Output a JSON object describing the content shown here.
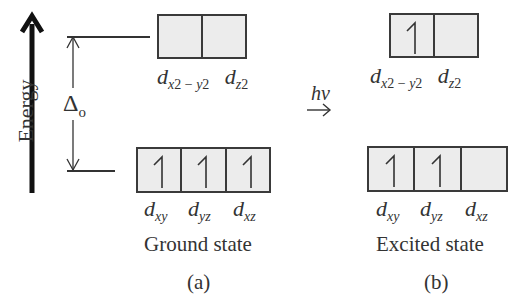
{
  "axis": {
    "label": "Energy",
    "icon": "up-arrow"
  },
  "splitting": {
    "symbol": "Δ",
    "subscript": "o"
  },
  "transition": {
    "label": "hν",
    "icon": "right-arrow"
  },
  "ground": {
    "caption": "Ground state",
    "panel": "(a)",
    "eg": [
      {
        "orbital": "x²−y²",
        "electrons": 0
      },
      {
        "orbital": "z²",
        "electrons": 0
      }
    ],
    "t2g": [
      {
        "orbital": "xy",
        "electrons": 1
      },
      {
        "orbital": "yz",
        "electrons": 1
      },
      {
        "orbital": "xz",
        "electrons": 1
      }
    ],
    "eg_labels": {
      "d1": "d",
      "s1": "x",
      "p1": "2",
      "m": " − ",
      "s1b": "y",
      "p1b": "2",
      "d2": "d",
      "s2": "z",
      "p2": "2"
    },
    "t2g_labels": {
      "d": "d",
      "a": "xy",
      "b": "yz",
      "c": "xz"
    }
  },
  "excited": {
    "caption": "Excited state",
    "panel": "(b)",
    "eg": [
      {
        "orbital": "x²−y²",
        "electrons": 1
      },
      {
        "orbital": "z²",
        "electrons": 0
      }
    ],
    "t2g": [
      {
        "orbital": "xy",
        "electrons": 1
      },
      {
        "orbital": "yz",
        "electrons": 1
      },
      {
        "orbital": "xz",
        "electrons": 0
      }
    ],
    "eg_labels": {
      "d1": "d",
      "s1": "x",
      "p1": "2",
      "m": " − ",
      "s1b": "y",
      "p1b": "2",
      "d2": "d",
      "s2": "z",
      "p2": "2"
    },
    "t2g_labels": {
      "d": "d",
      "a": "xy",
      "b": "yz",
      "c": "xz"
    }
  },
  "colors": {
    "box_fill": "#ececec",
    "stroke": "#3a3a3a"
  }
}
